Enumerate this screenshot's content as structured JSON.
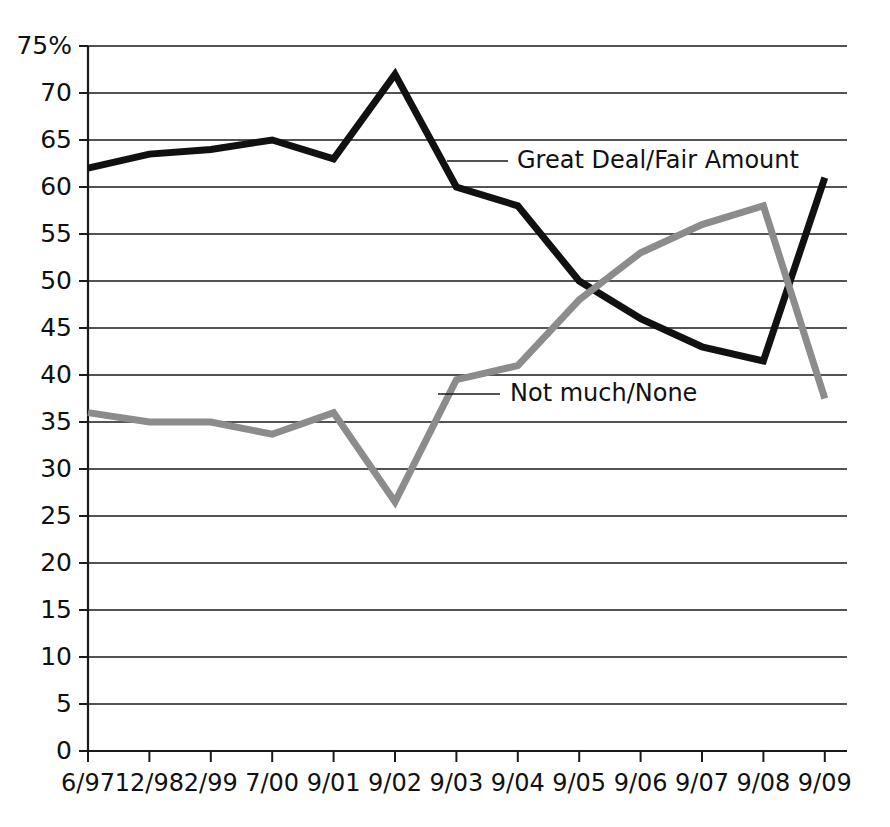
{
  "chart_data": {
    "type": "line",
    "title": "",
    "subtitle": "",
    "xlabel": "",
    "ylabel": "",
    "ylim": [
      0,
      75
    ],
    "ytick_labels": [
      "75%",
      "70",
      "65",
      "60",
      "55",
      "50",
      "45",
      "40",
      "35",
      "30",
      "25",
      "20",
      "15",
      "10",
      "5",
      "0"
    ],
    "ytick_values": [
      75,
      70,
      65,
      60,
      55,
      50,
      45,
      40,
      35,
      30,
      25,
      20,
      15,
      10,
      5,
      0
    ],
    "grid": true,
    "grid_axis": "y",
    "legend_position": "inline-annotation",
    "categories": [
      "6/97",
      "12/98",
      "2/99",
      "7/00",
      "9/01",
      "9/02",
      "9/03",
      "9/04",
      "9/05",
      "9/06",
      "9/07",
      "9/08",
      "9/09"
    ],
    "series": [
      {
        "name": "Great Deal/Fair Amount",
        "color": "#111111",
        "line_width": 7,
        "values": [
          62,
          63.5,
          64,
          65,
          63,
          72,
          60,
          58,
          50,
          46,
          43,
          41.5,
          61
        ]
      },
      {
        "name": "Not much/None",
        "color": "#8c8c8c",
        "line_width": 7,
        "values": [
          36,
          35,
          35,
          33.7,
          36,
          26.5,
          39.5,
          41,
          48,
          53,
          56,
          58,
          37.5
        ]
      }
    ],
    "annotations": [
      {
        "text": "Great Deal/Fair Amount",
        "series": "Great Deal/Fair Amount",
        "x": 517,
        "y": 161,
        "leader_x1": 447,
        "leader_x2": 508
      },
      {
        "text": "Not much/None",
        "series": "Not much/None",
        "x": 510,
        "y": 394,
        "leader_x1": 438,
        "leader_x2": 500
      }
    ]
  },
  "plot_geometry": {
    "left": 88,
    "right": 847,
    "top": 46,
    "bottom": 751,
    "first_point_x": 88,
    "point_spacing": 61.4
  }
}
